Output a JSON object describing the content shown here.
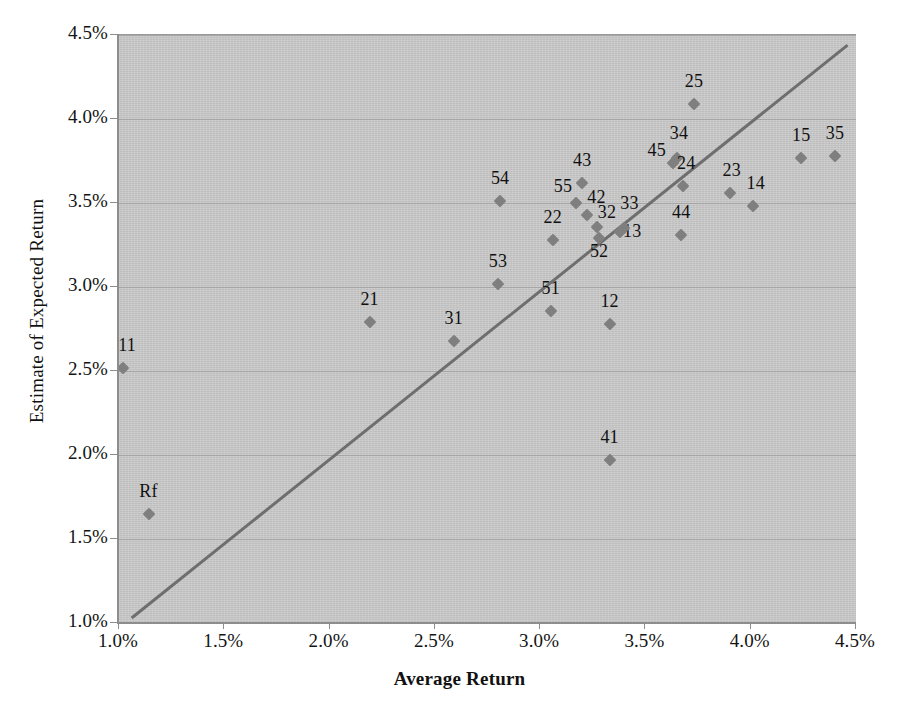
{
  "chart_data": {
    "type": "scatter",
    "title": "",
    "xlabel": "Average Return",
    "ylabel": "Estimate of Expected Return",
    "xlim": [
      1.0,
      4.5
    ],
    "ylim": [
      1.0,
      4.5
    ],
    "xticks": [
      "1.0%",
      "1.5%",
      "2.0%",
      "2.5%",
      "3.0%",
      "3.5%",
      "4.0%",
      "4.5%"
    ],
    "xtick_values": [
      1.0,
      1.5,
      2.0,
      2.5,
      3.0,
      3.5,
      4.0,
      4.5
    ],
    "yticks": [
      "1.0%",
      "1.5%",
      "2.0%",
      "2.5%",
      "3.0%",
      "3.5%",
      "4.0%",
      "4.5%"
    ],
    "ytick_values": [
      1.0,
      1.5,
      2.0,
      2.5,
      3.0,
      3.5,
      4.0,
      4.5
    ],
    "grid": "horizontal",
    "legend": "none",
    "plot_background": "#c9c9c9",
    "marker_color": "#7f7f7f",
    "line_color": "#6e6e6e",
    "reference_line": {
      "label": "45-degree line",
      "x": [
        1.06,
        4.46
      ],
      "y": [
        1.03,
        4.44
      ]
    },
    "points": [
      {
        "label": "Rf",
        "x": 1.14,
        "y": 1.65,
        "label_dx": 0,
        "label_dy": -12
      },
      {
        "label": "11",
        "x": 1.02,
        "y": 2.52,
        "label_dx": 4,
        "label_dy": -12
      },
      {
        "label": "21",
        "x": 2.19,
        "y": 2.79,
        "label_dx": 0,
        "label_dy": -12
      },
      {
        "label": "31",
        "x": 2.59,
        "y": 2.68,
        "label_dx": 0,
        "label_dy": -12
      },
      {
        "label": "53",
        "x": 2.8,
        "y": 3.02,
        "label_dx": 0,
        "label_dy": -12
      },
      {
        "label": "54",
        "x": 2.81,
        "y": 3.51,
        "label_dx": 0,
        "label_dy": -12
      },
      {
        "label": "51",
        "x": 3.05,
        "y": 2.86,
        "label_dx": 0,
        "label_dy": -12
      },
      {
        "label": "22",
        "x": 3.06,
        "y": 3.28,
        "label_dx": 0,
        "label_dy": -12
      },
      {
        "label": "55",
        "x": 3.17,
        "y": 3.5,
        "label_dx": -13,
        "label_dy": -6
      },
      {
        "label": "43",
        "x": 3.2,
        "y": 3.62,
        "label_dx": 0,
        "label_dy": -12
      },
      {
        "label": "42",
        "x": 3.22,
        "y": 3.43,
        "label_dx": 10,
        "label_dy": -7
      },
      {
        "label": "32",
        "x": 3.27,
        "y": 3.36,
        "label_dx": 10,
        "label_dy": -4
      },
      {
        "label": "52",
        "x": 3.28,
        "y": 3.29,
        "label_dx": 0,
        "label_dy": 24
      },
      {
        "label": "12",
        "x": 3.33,
        "y": 2.78,
        "label_dx": 0,
        "label_dy": -12
      },
      {
        "label": "13",
        "x": 3.38,
        "y": 3.33,
        "label_dx": 12,
        "label_dy": 10
      },
      {
        "label": "33",
        "x": 3.4,
        "y": 3.35,
        "label_dx": 5,
        "label_dy": -14
      },
      {
        "label": "41",
        "x": 3.33,
        "y": 1.97,
        "label_dx": 0,
        "label_dy": -12
      },
      {
        "label": "45",
        "x": 3.63,
        "y": 3.74,
        "label_dx": -16,
        "label_dy": -2
      },
      {
        "label": "34",
        "x": 3.65,
        "y": 3.77,
        "label_dx": 2,
        "label_dy": -14
      },
      {
        "label": "44",
        "x": 3.67,
        "y": 3.31,
        "label_dx": 0,
        "label_dy": -12
      },
      {
        "label": "24",
        "x": 3.68,
        "y": 3.6,
        "label_dx": 3,
        "label_dy": -12
      },
      {
        "label": "25",
        "x": 3.73,
        "y": 4.09,
        "label_dx": 0,
        "label_dy": -12
      },
      {
        "label": "23",
        "x": 3.9,
        "y": 3.56,
        "label_dx": 2,
        "label_dy": -12
      },
      {
        "label": "14",
        "x": 4.01,
        "y": 3.48,
        "label_dx": 3,
        "label_dy": -12
      },
      {
        "label": "15",
        "x": 4.24,
        "y": 3.77,
        "label_dx": 0,
        "label_dy": -12
      },
      {
        "label": "35",
        "x": 4.4,
        "y": 3.78,
        "label_dx": 0,
        "label_dy": -12
      }
    ]
  }
}
